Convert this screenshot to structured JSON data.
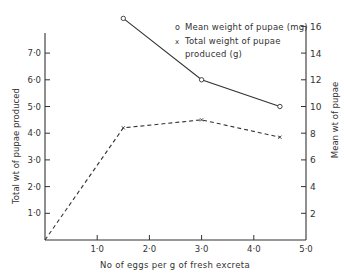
{
  "chart_data": {
    "type": "line",
    "title": "",
    "xlabel": "No of eggs per g of fresh excreta",
    "ylabel_left": "Total wt of pupae produced",
    "ylabel_right": "Mean wt of pupae",
    "xlim": [
      0,
      5.0
    ],
    "ylim_left": [
      0,
      7.8
    ],
    "ylim_right": [
      0,
      16
    ],
    "x_ticks": [
      "1·0",
      "2·0",
      "3·0",
      "4·0",
      "5·0"
    ],
    "x_tick_values": [
      1,
      2,
      3,
      4,
      5
    ],
    "y_left_ticks": [
      "1·0",
      "2·0",
      "3·0",
      "4·0",
      "5·0",
      "6·0",
      "7·0"
    ],
    "y_left_tick_values": [
      1,
      2,
      3,
      4,
      5,
      6,
      7
    ],
    "y_right_ticks": [
      "2",
      "4",
      "6",
      "8",
      "10",
      "12",
      "14",
      "16"
    ],
    "y_right_tick_values": [
      2,
      4,
      6,
      8,
      10,
      12,
      14,
      16
    ],
    "grid": false,
    "legend_position": "top-right",
    "series": [
      {
        "name": "Mean weight of pupae (mg)",
        "axis": "right",
        "marker": "o",
        "line_style": "solid",
        "x": [
          1.5,
          3.0,
          4.5
        ],
        "values": [
          16.6,
          12.0,
          10.0
        ]
      },
      {
        "name": "Total weight of pupae produced (g)",
        "axis": "left",
        "marker": "x",
        "line_style": "dashed",
        "x": [
          0,
          1.5,
          3.0,
          4.5
        ],
        "values": [
          0,
          4.2,
          4.5,
          3.85
        ]
      }
    ]
  },
  "legend": {
    "item1_marker": "o",
    "item1_text": "Mean weight of pupae (mg)",
    "item2_marker": "x",
    "item2_line1": "Total weight of pupae",
    "item2_line2": "produced (g)"
  },
  "colors": {
    "ink": "#333333",
    "background": "#ffffff"
  }
}
